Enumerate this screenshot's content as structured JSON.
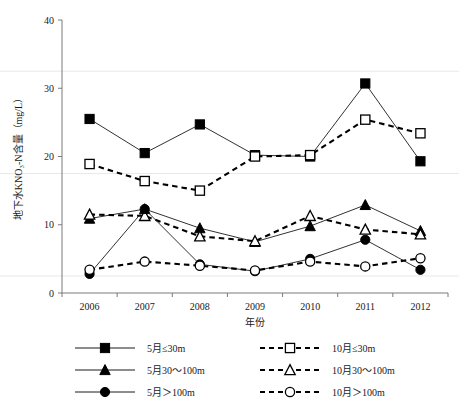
{
  "chart_data": {
    "type": "line",
    "title": "",
    "xlabel": "年份",
    "ylabel": "地下水KNO₃-N含量（mg/L）",
    "categories": [
      "2006",
      "2007",
      "2008",
      "2009",
      "2010",
      "2011",
      "2012"
    ],
    "xlim": [
      2005.5,
      2012.5
    ],
    "ylim": [
      0,
      40
    ],
    "yticks": [
      "0",
      "10",
      "20",
      "30",
      "40"
    ],
    "grid": "horizontal-light",
    "legend_position": "bottom",
    "series": [
      {
        "name": "5月≤30m",
        "marker": "filled-square",
        "line": "solid",
        "values": [
          25.5,
          20.5,
          24.7,
          20.2,
          20.0,
          30.7,
          19.3
        ]
      },
      {
        "name": "10月≤30m",
        "marker": "open-square",
        "line": "dashed",
        "values": [
          18.9,
          16.4,
          15.0,
          20.0,
          20.2,
          25.4,
          23.4
        ]
      },
      {
        "name": "5月30~100m",
        "marker": "filled-triangle",
        "line": "solid",
        "values": [
          10.9,
          12.3,
          9.5,
          7.5,
          9.8,
          12.9,
          9.1
        ]
      },
      {
        "name": "10月30~100m",
        "marker": "open-triangle",
        "line": "dashed",
        "values": [
          11.5,
          11.3,
          8.3,
          7.6,
          11.3,
          9.3,
          8.6
        ]
      },
      {
        "name": "5月>100m",
        "marker": "filled-circle",
        "line": "solid",
        "values": [
          2.8,
          12.3,
          4.2,
          3.2,
          5.0,
          7.8,
          3.4
        ]
      },
      {
        "name": "10月>100m",
        "marker": "open-circle",
        "line": "dashed",
        "values": [
          3.4,
          4.6,
          4.0,
          3.3,
          4.6,
          3.9,
          5.1
        ]
      }
    ]
  },
  "legend": {
    "entries": [
      {
        "label": "5月≤30m",
        "marker": "filled-square",
        "line": "solid"
      },
      {
        "label": "10月≤30m",
        "marker": "open-square",
        "line": "dashed"
      },
      {
        "label": "5月30～100m",
        "marker": "filled-triangle",
        "line": "solid"
      },
      {
        "label": "10月30～100m",
        "marker": "open-triangle",
        "line": "dashed"
      },
      {
        "label": "5月＞100m",
        "marker": "filled-circle",
        "line": "solid"
      },
      {
        "label": "10月＞100m",
        "marker": "open-circle",
        "line": "dashed"
      }
    ]
  }
}
